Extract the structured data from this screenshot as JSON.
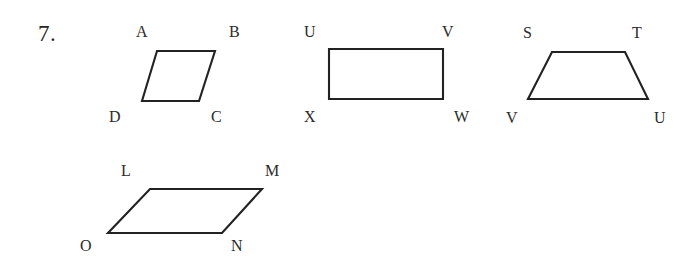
{
  "page": {
    "background_color": "#ffffff",
    "ink_color": "#222222",
    "width": 693,
    "height": 257
  },
  "question": {
    "number_label": "7.",
    "x": 38,
    "y": 22,
    "font_size": 23
  },
  "figures": [
    {
      "id": "figure-abcd",
      "shape_type": "parallelogram",
      "name": "ABCD",
      "points": "157,51 215,51 199,101 142,101",
      "vertices": [
        {
          "letter": "A",
          "x": 136,
          "y": 24
        },
        {
          "letter": "B",
          "x": 229,
          "y": 24
        },
        {
          "letter": "C",
          "x": 211,
          "y": 109
        },
        {
          "letter": "D",
          "x": 109,
          "y": 109
        }
      ]
    },
    {
      "id": "figure-uvwx",
      "shape_type": "rectangle",
      "name": "UVWX",
      "points": "329,49 443,49 443,99 329,99",
      "vertices": [
        {
          "letter": "U",
          "x": 304,
          "y": 24
        },
        {
          "letter": "V",
          "x": 442,
          "y": 24
        },
        {
          "letter": "W",
          "x": 454,
          "y": 109
        },
        {
          "letter": "X",
          "x": 304,
          "y": 109
        }
      ]
    },
    {
      "id": "figure-stuv",
      "shape_type": "trapezoid",
      "name": "STUV",
      "points": "552,52 625,52 648,99 528,99",
      "vertices": [
        {
          "letter": "S",
          "x": 523,
          "y": 25
        },
        {
          "letter": "T",
          "x": 632,
          "y": 25
        },
        {
          "letter": "U",
          "x": 654,
          "y": 110
        },
        {
          "letter": "V",
          "x": 506,
          "y": 110
        }
      ]
    },
    {
      "id": "figure-lmno",
      "shape_type": "parallelogram",
      "name": "LMNO",
      "points": "150,189 262,189 222,233 108,233",
      "vertices": [
        {
          "letter": "L",
          "x": 121,
          "y": 163
        },
        {
          "letter": "M",
          "x": 265,
          "y": 163
        },
        {
          "letter": "N",
          "x": 231,
          "y": 238
        },
        {
          "letter": "O",
          "x": 80,
          "y": 238
        }
      ]
    }
  ]
}
